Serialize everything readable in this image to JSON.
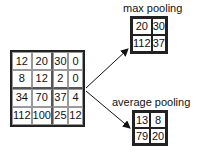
{
  "input": {
    "values": [
      [
        "12",
        "20",
        "30",
        "0"
      ],
      [
        "8",
        "12",
        "2",
        "0"
      ],
      [
        "34",
        "70",
        "37",
        "4"
      ],
      [
        "112",
        "100",
        "25",
        "12"
      ]
    ]
  },
  "max_pooling": {
    "label": "max pooling",
    "values": [
      [
        "20",
        "30"
      ],
      [
        "112",
        "37"
      ]
    ]
  },
  "average_pooling": {
    "label": "average pooling",
    "values": [
      [
        "13",
        "8"
      ],
      [
        "79",
        "20"
      ]
    ]
  }
}
